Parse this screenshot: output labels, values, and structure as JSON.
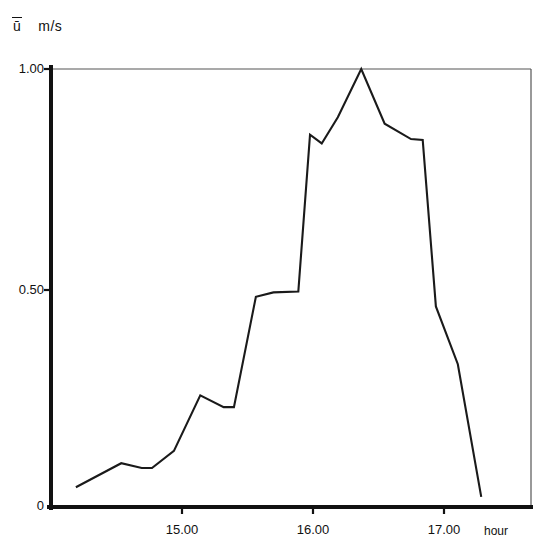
{
  "chart_data": {
    "type": "line",
    "title": "",
    "xlabel": "hour",
    "ylabel": "ū  m/s",
    "y_axis_symbol": "ū",
    "y_axis_unit": "m/s",
    "xlim": [
      14.38,
      17.66
    ],
    "ylim": [
      0,
      1.0
    ],
    "grid": false,
    "legend": null,
    "xticks": [
      15.0,
      16.0,
      17.0
    ],
    "xtick_labels": [
      "15.00",
      "16.00",
      "17.00"
    ],
    "yticks": [
      0,
      0.5,
      1.0
    ],
    "ytick_labels": [
      "0",
      "0.50",
      "1.00"
    ],
    "line_color": "#1a1a1a",
    "series": [
      {
        "name": "ū",
        "x": [
          14.55,
          14.86,
          15.0,
          15.07,
          15.22,
          15.4,
          15.56,
          15.63,
          15.78,
          15.9,
          16.07,
          16.15,
          16.23,
          16.34,
          16.5,
          16.66,
          16.84,
          16.92,
          17.01,
          17.16,
          17.32
        ],
        "y": [
          0.045,
          0.1,
          0.089,
          0.089,
          0.128,
          0.255,
          0.228,
          0.228,
          0.48,
          0.49,
          0.492,
          0.85,
          0.83,
          0.89,
          1.0,
          0.875,
          0.84,
          0.838,
          0.458,
          0.326,
          0.023
        ]
      }
    ]
  },
  "axes": {
    "y_label_prefix": "ū",
    "y_label_unit": "m/s"
  }
}
